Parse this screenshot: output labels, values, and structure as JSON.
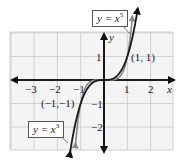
{
  "chart_data": {
    "type": "line",
    "title": "",
    "xlabel": "x",
    "ylabel": "y",
    "xlim": [
      -4,
      3
    ],
    "ylim": [
      -3,
      2
    ],
    "grid": true,
    "x_ticks": [
      -3,
      -2,
      -1,
      1,
      2
    ],
    "y_ticks": [
      1,
      -1,
      -2
    ],
    "x_tick_labels": [
      "−3",
      "−2",
      "−1",
      "1",
      "2"
    ],
    "y_tick_labels": [
      "1",
      "−1",
      "−2"
    ],
    "series": [
      {
        "name": "y = x^3",
        "label": "y = x",
        "exponent": "3",
        "color": "#1a1a1a",
        "function": "x^3",
        "x_range": [
          -1.45,
          1.45
        ]
      },
      {
        "name": "y = x^5",
        "label": "y = x",
        "exponent": "5",
        "color": "#888888",
        "function": "x^5",
        "x_range": [
          -1.22,
          1.22
        ]
      }
    ],
    "annotations": [
      {
        "text": "(1, 1)",
        "x": 1,
        "y": 1
      },
      {
        "text": "(−1,−1)",
        "x": -1,
        "y": -1
      }
    ],
    "legend": "callout boxes"
  },
  "labels": {
    "x_axis": "x",
    "y_axis": "y",
    "point_pos": "(1, 1)",
    "point_neg": "(−1,−1)",
    "callout_x5_base": "y = x",
    "callout_x5_exp": "5",
    "callout_x3_base": "y = x",
    "callout_x3_exp": "3",
    "tick_xm3": "−3",
    "tick_xm2": "−2",
    "tick_xm1": "−1",
    "tick_x1": "1",
    "tick_x2": "2",
    "tick_y1": "1",
    "tick_ym1": "−1",
    "tick_ym2": "−2"
  },
  "colors": {
    "grid": "#c8c8c8",
    "axis": "#111111",
    "x3_curve": "#1a1a1a",
    "x5_curve": "#888888",
    "background": "#f4f4f4"
  }
}
